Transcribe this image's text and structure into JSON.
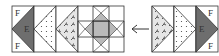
{
  "diagram": {
    "type": "quilt-block-assembly",
    "colors": {
      "background": "#ffffff",
      "outline": "#333333",
      "dark_fabric": "#6e6e6e",
      "medium_fabric": "#b9b9b9",
      "light_fabric": "#ffffff",
      "print_fabric": "#e4e4e4"
    },
    "left_unit": {
      "pieces": [
        {
          "kind": "flying-geese",
          "center_label": "E",
          "corner_labels": [
            "F",
            "F"
          ]
        },
        {
          "kind": "triangle-dotted"
        },
        {
          "kind": "triangle-leaf-print"
        },
        {
          "kind": "sawtooth-star"
        }
      ]
    },
    "arrow": {
      "direction": "left",
      "glyph": "←"
    },
    "right_unit": {
      "pieces": [
        {
          "kind": "triangle-leaf-print"
        },
        {
          "kind": "triangle-dotted"
        },
        {
          "kind": "flying-geese",
          "center_label": "E",
          "corner_labels": [
            "F",
            "F"
          ]
        }
      ]
    },
    "labels": {
      "left_E": "E",
      "left_F_top": "F",
      "left_F_bottom": "F",
      "right_E": "E",
      "right_F_top": "F",
      "right_F_bottom": "F"
    }
  }
}
